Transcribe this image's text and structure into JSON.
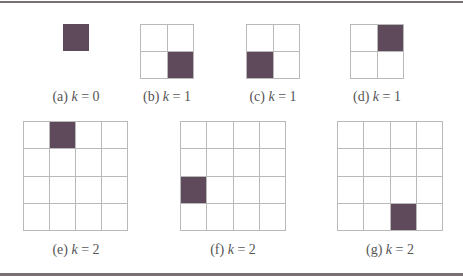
{
  "figure": {
    "fill_color": "#5e4a5a",
    "line_color": "#b9b9b9",
    "rule_color": "#7a6f72",
    "panels": [
      {
        "id": "a",
        "label": "(a)",
        "k_text": "k",
        "eq": "= 0",
        "k": 0,
        "size": 1,
        "filled": [
          0,
          0
        ]
      },
      {
        "id": "b",
        "label": "(b)",
        "k_text": "k",
        "eq": "= 1",
        "k": 1,
        "size": 2,
        "filled": [
          1,
          1
        ]
      },
      {
        "id": "c",
        "label": "(c)",
        "k_text": "k",
        "eq": "= 1",
        "k": 1,
        "size": 2,
        "filled": [
          1,
          0
        ]
      },
      {
        "id": "d",
        "label": "(d)",
        "k_text": "k",
        "eq": "= 1",
        "k": 1,
        "size": 2,
        "filled": [
          0,
          1
        ]
      },
      {
        "id": "e",
        "label": "(e)",
        "k_text": "k",
        "eq": "= 2",
        "k": 2,
        "size": 4,
        "filled": [
          0,
          1
        ]
      },
      {
        "id": "f",
        "label": "(f)",
        "k_text": "k",
        "eq": "= 2",
        "k": 2,
        "size": 4,
        "filled": [
          2,
          0
        ]
      },
      {
        "id": "g",
        "label": "(g)",
        "k_text": "k",
        "eq": "= 2",
        "k": 2,
        "size": 4,
        "filled": [
          3,
          2
        ]
      }
    ]
  }
}
